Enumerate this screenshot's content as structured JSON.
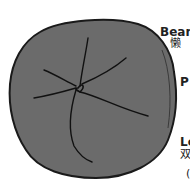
{
  "diagram": {
    "fill_color": "#6b6b6b",
    "outline_color": "#1a1a1a",
    "labels": [
      {
        "en": "Bean",
        "zh": "懒"
      },
      {
        "en": "P",
        "zh": ""
      },
      {
        "en": "Lo",
        "zh": "双"
      },
      {
        "en": "",
        "zh": "("
      }
    ]
  }
}
